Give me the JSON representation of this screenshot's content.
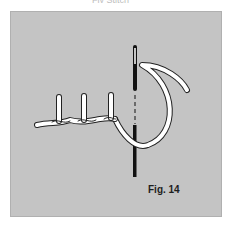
{
  "figure": {
    "top_caption_fragment": "Fly Stitch",
    "label": "Fig. 14",
    "panel_color": "#c4c4c4",
    "thread_color": "#ffffff",
    "needle_color": "#111111"
  }
}
